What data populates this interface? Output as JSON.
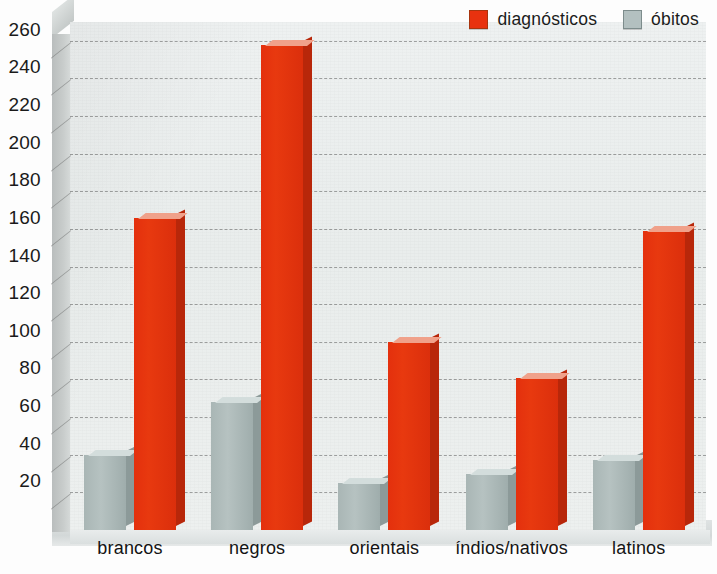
{
  "chart_data": {
    "type": "bar",
    "title": "",
    "subtitle": "",
    "xlabel": "",
    "ylabel": "",
    "categories": [
      "brancos",
      "negros",
      "orientais",
      "índios/nativos",
      "latinos"
    ],
    "series": [
      {
        "name": "diágnosticos_placeholder",
        "label": "diagnósticos",
        "color": "#e8320f",
        "values": [
          166,
          258,
          100,
          81,
          159
        ]
      },
      {
        "name": "obitos_placeholder",
        "label": "óbitos",
        "color": "#b3c0c0",
        "values": [
          40,
          68,
          25,
          30,
          37
        ]
      }
    ],
    "yticks": [
      20,
      40,
      60,
      80,
      100,
      120,
      140,
      160,
      180,
      200,
      220,
      240,
      260
    ],
    "ylim": [
      0,
      270
    ],
    "grid": true,
    "legend_position": "top-right",
    "style": "3d-column"
  },
  "legend": {
    "entries": [
      {
        "label": "diagnósticos",
        "swatch": "red"
      },
      {
        "label": "óbitos",
        "swatch": "grey"
      }
    ]
  },
  "colors": {
    "diagnosticos": "#e8320f",
    "obitos": "#b3c0c0",
    "background": "#eef1f1",
    "gridline": "#3c3c3c",
    "text": "#1a1a1a"
  }
}
